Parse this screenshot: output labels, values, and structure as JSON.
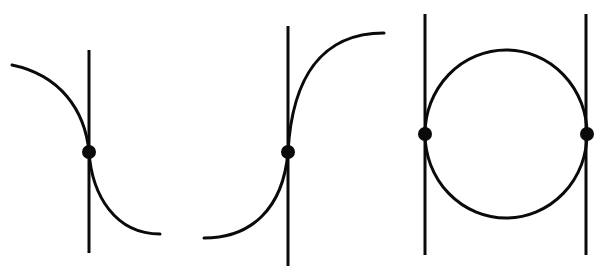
{
  "diagram": {
    "type": "tangency-figures",
    "stroke_color": "#0a0a0a",
    "background": "#ffffff",
    "figures": [
      {
        "id": "figure-1",
        "description": "decreasing curve tangent to vertical line at inflection point",
        "vertical_line": {
          "x": 89,
          "y1": 50,
          "y2": 253
        },
        "curve_path": "M 12 65 C 60 75, 85 110, 89 152 C 92 195, 115 234, 160 234",
        "tangent_point": {
          "x": 89,
          "y": 152
        }
      },
      {
        "id": "figure-2",
        "description": "increasing curve tangent to vertical line at inflection point",
        "vertical_line": {
          "x": 288,
          "y1": 26,
          "y2": 266
        },
        "curve_path": "M 204 238 C 250 238, 283 210, 288 152 C 292 80, 320 33, 384 33",
        "tangent_point": {
          "x": 288,
          "y": 152
        }
      },
      {
        "id": "figure-3",
        "description": "circle tangent to two parallel vertical lines",
        "vertical_lines": [
          {
            "x": 425,
            "y1": 14,
            "y2": 255
          },
          {
            "x": 586,
            "y1": 14,
            "y2": 255
          }
        ],
        "circle": {
          "cx": 506,
          "cy": 134,
          "rx": 81,
          "ry": 84
        },
        "tangent_points": [
          {
            "x": 425,
            "y": 134
          },
          {
            "x": 587,
            "y": 134
          }
        ]
      }
    ]
  }
}
